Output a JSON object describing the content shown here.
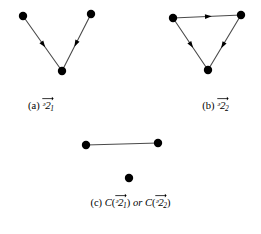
{
  "figure": {
    "width": 261,
    "height": 234,
    "background_color": "#ffffff",
    "ink_color": "#000000",
    "edge_color": "#4a4a4a"
  },
  "panels": [
    {
      "id": "a",
      "label": "(a)",
      "symbol_glyph": "ᵊ2",
      "symbol_plain": "G",
      "subscript": "1",
      "caption_text": "(a) G⃗1",
      "graph_type": "directed",
      "vertices": [
        {
          "name": "top-left",
          "x": 23,
          "y": 16
        },
        {
          "name": "top-right",
          "x": 91,
          "y": 14
        },
        {
          "name": "bottom",
          "x": 62,
          "y": 71
        }
      ],
      "edges": [
        {
          "from": "top-left",
          "to": "bottom",
          "directed": true,
          "arrow_position": 0.52
        },
        {
          "from": "top-right",
          "to": "bottom",
          "directed": true,
          "arrow_position": 0.52
        }
      ]
    },
    {
      "id": "b",
      "label": "(b)",
      "symbol_glyph": "ᵊ2",
      "symbol_plain": "G",
      "subscript": "2",
      "caption_text": "(b) G⃗2",
      "graph_type": "directed",
      "vertices": [
        {
          "name": "top-left",
          "x": 43,
          "y": 18
        },
        {
          "name": "top-right",
          "x": 111,
          "y": 15
        },
        {
          "name": "bottom",
          "x": 78,
          "y": 70
        }
      ],
      "edges": [
        {
          "from": "top-left",
          "to": "top-right",
          "directed": true,
          "arrow_position": 0.52
        },
        {
          "from": "top-left",
          "to": "bottom",
          "directed": true,
          "arrow_position": 0.52
        },
        {
          "from": "top-right",
          "to": "bottom",
          "directed": true,
          "arrow_position": 0.55
        }
      ]
    },
    {
      "id": "c",
      "label": "(c)",
      "symbol_glyph": "ᵊ2",
      "symbol_plain": "G",
      "function_name": "C",
      "conjunction": "or",
      "subscript_first": "1",
      "subscript_second": "2",
      "caption_text": "(c) C(G⃗1) or C(G⃗2)",
      "graph_type": "undirected",
      "vertices": [
        {
          "name": "left",
          "x": 86,
          "y": 25
        },
        {
          "name": "right",
          "x": 158,
          "y": 23
        },
        {
          "name": "isolated",
          "x": 129,
          "y": 58
        }
      ],
      "edges": [
        {
          "from": "left",
          "to": "right",
          "directed": false
        }
      ]
    }
  ],
  "style": {
    "vertex_radius": 4.2,
    "edge_width": 1.1,
    "arrow_size": 4.5
  }
}
